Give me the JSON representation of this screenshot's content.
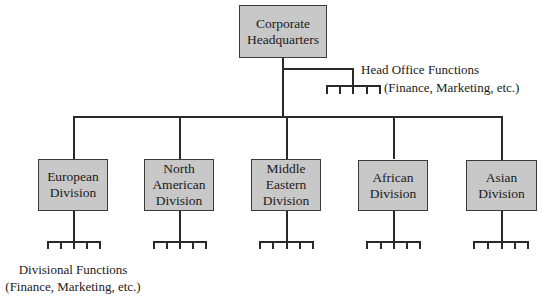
{
  "diagram": {
    "type": "organizational-chart",
    "root": {
      "label_lines": [
        "Corporate",
        "Headquarters"
      ]
    },
    "head_office_functions": {
      "title": "Head Office Functions",
      "subtitle": "(Finance, Marketing, etc.)"
    },
    "divisions": [
      {
        "label_lines": [
          "European",
          "Division"
        ]
      },
      {
        "label_lines": [
          "North",
          "American",
          "Division"
        ]
      },
      {
        "label_lines": [
          "Middle",
          "Eastern",
          "Division"
        ]
      },
      {
        "label_lines": [
          "African",
          "Division"
        ]
      },
      {
        "label_lines": [
          "Asian",
          "Division"
        ]
      }
    ],
    "divisional_functions": {
      "title": "Divisional Functions",
      "subtitle": "(Finance, Marketing, etc.)"
    },
    "colors": {
      "box_fill": "#c8c8c8",
      "line": "#2a2a2a"
    }
  }
}
